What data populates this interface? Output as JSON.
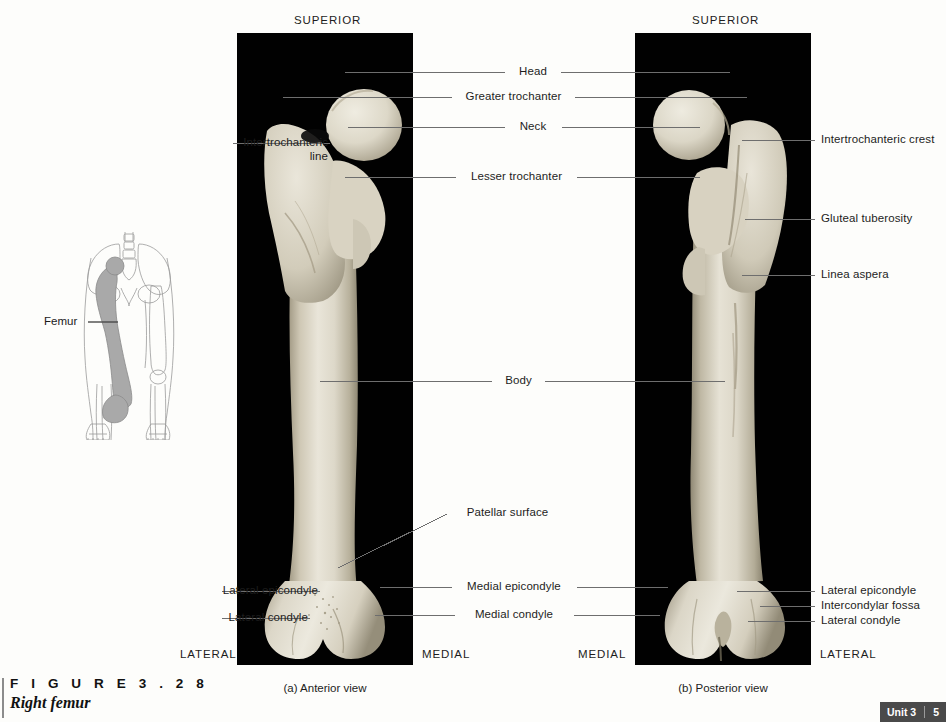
{
  "figure": {
    "number_label": "F I G U R E   3 . 2 8",
    "title": "Right femur"
  },
  "panels": [
    {
      "id": "anterior",
      "view_caption": "(a) Anterior view",
      "superior": "SUPERIOR",
      "left_orient": "LATERAL",
      "right_orient": "MEDIAL"
    },
    {
      "id": "posterior",
      "view_caption": "(b) Posterior view",
      "superior": "SUPERIOR",
      "left_orient": "MEDIAL",
      "right_orient": "LATERAL"
    }
  ],
  "labels": {
    "head": "Head",
    "greater_trochanter": "Greater trochanter",
    "neck": "Neck",
    "lesser_trochanter": "Lesser trochanter",
    "body": "Body",
    "intertrochanteric_line": "Intertrochanteric\nline",
    "intertrochanteric_crest": "Intertrochanteric crest",
    "gluteal_tuberosity": "Gluteal tuberosity",
    "linea_aspera": "Linea aspera",
    "patellar_surface": "Patellar surface",
    "lateral_epicondyle_left": "Lateral epicondyle",
    "lateral_condyle_left": "Lateral condyle",
    "medial_epicondyle": "Medial epicondyle",
    "medial_condyle": "Medial condyle",
    "lateral_epicondyle_right": "Lateral epicondyle",
    "intercondylar_fossa": "Intercondylar fossa",
    "lateral_condyle_right": "Lateral condyle"
  },
  "inset": {
    "label": "Femur",
    "bone_fill": "#a9a9a9",
    "outline": "#9b9b9b"
  },
  "footer": {
    "unit": "Unit 3",
    "page": "5"
  },
  "colors": {
    "panel_background": "#000000",
    "page_background": "#fdfdfb",
    "leader": "#6e6e6e",
    "bone_light": "#e8e4d8",
    "bone_mid": "#cfc9b8",
    "bone_shadow": "#9a937f"
  }
}
